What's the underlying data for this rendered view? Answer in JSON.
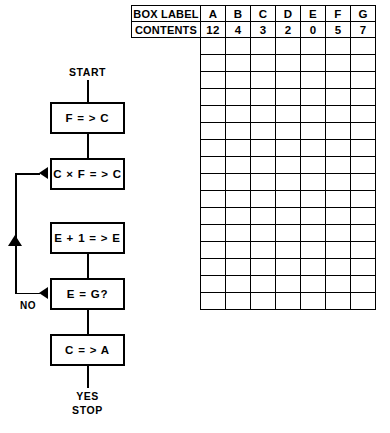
{
  "flowchart": {
    "start_label": "START",
    "stop_label": "STOP",
    "yes_label": "YES",
    "no_label": "NO",
    "steps": [
      {
        "name": "assign-f-to-c",
        "text": "F = > C"
      },
      {
        "name": "multiply-c-by-f",
        "text": "C × F = > C"
      },
      {
        "name": "increment-e",
        "text": "E + 1 = > E"
      },
      {
        "name": "compare-e-to-g",
        "text": "E = G?"
      },
      {
        "name": "assign-c-to-a",
        "text": "C = > A"
      }
    ]
  },
  "table": {
    "row_headers": [
      "BOX LABEL",
      "CONTENTS"
    ],
    "columns": [
      "A",
      "B",
      "C",
      "D",
      "E",
      "F",
      "G"
    ],
    "contents": [
      "12",
      "4",
      "3",
      "2",
      "0",
      "5",
      "7"
    ],
    "empty_row_count": 16
  },
  "colors": {
    "stroke": "#000000",
    "background": "#ffffff"
  }
}
